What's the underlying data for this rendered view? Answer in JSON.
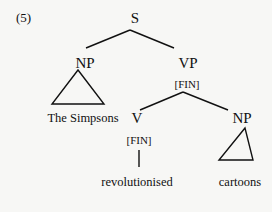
{
  "example_number": "(5)",
  "tree": {
    "root": {
      "label": "S"
    },
    "subject": {
      "label": "NP",
      "yield": "The Simpsons",
      "roof": "triangle"
    },
    "predicate": {
      "label": "VP",
      "feature": "[FIN]",
      "verb": {
        "label": "V",
        "feature": "[FIN]",
        "word": "revolutionised"
      },
      "object": {
        "label": "NP",
        "yield": "cartoons",
        "roof": "triangle"
      }
    }
  }
}
